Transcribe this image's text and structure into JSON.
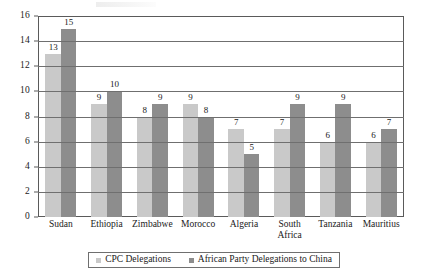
{
  "chart_data": {
    "type": "bar",
    "title": "",
    "subtitle": "",
    "xlabel": "",
    "ylabel": "",
    "ylim": [
      0,
      16
    ],
    "ytick_step": 2,
    "yticks": [
      0,
      2,
      4,
      6,
      8,
      10,
      12,
      14,
      16
    ],
    "grid": true,
    "grid_axis": "y",
    "legend_position": "bottom",
    "categories": [
      "Sudan",
      "Ethiopia",
      "Zimbabwe",
      "Morocco",
      "Algeria",
      "South Africa",
      "Tanzania",
      "Mauritius"
    ],
    "category_display": [
      "Sudan",
      "Ethiopia",
      "Zimbabwe",
      "Morocco",
      "Algeria",
      "South\nAfrica",
      "Tanzania",
      "Mauritius"
    ],
    "series": [
      {
        "name": "CPC Delegations",
        "color": "#c9c9c9",
        "values": [
          13,
          9,
          8,
          9,
          7,
          7,
          6,
          6
        ]
      },
      {
        "name": "African Party Delegations to China",
        "color": "#8d8d8d",
        "values": [
          15,
          10,
          9,
          8,
          5,
          9,
          9,
          7
        ]
      }
    ],
    "data_labels": true
  },
  "legend": {
    "items": [
      {
        "label": "CPC Delegations",
        "swatch": "light-gray-swatch"
      },
      {
        "label": "African Party Delegations to China",
        "swatch": "dark-gray-swatch"
      }
    ]
  }
}
